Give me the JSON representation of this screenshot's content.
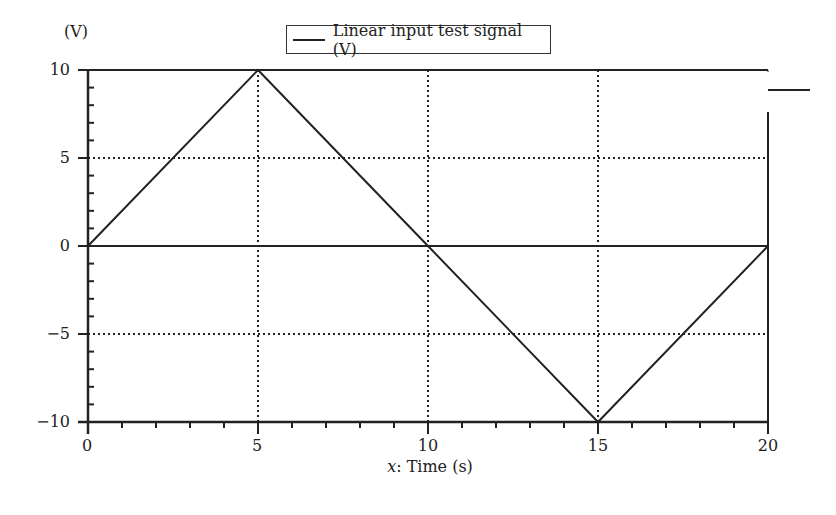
{
  "chart_data": {
    "type": "line",
    "title": "",
    "xlabel_var": "x",
    "xlabel_text": ": Time (s)",
    "xlabel": "x: Time (s)",
    "ylabel": "(V)",
    "xlim": [
      0,
      20
    ],
    "ylim": [
      -10,
      10
    ],
    "xticks": [
      "0",
      "5",
      "10",
      "15",
      "20"
    ],
    "yticks": [
      "10",
      "5",
      "0",
      "−5",
      "−10"
    ],
    "grid": true,
    "legend_position": "top-center",
    "series": [
      {
        "name": "Linear input test signal (V)",
        "x": [
          0,
          5,
          10,
          15,
          20
        ],
        "y": [
          0,
          10,
          0,
          -10,
          0
        ],
        "color": "#222222"
      }
    ]
  }
}
